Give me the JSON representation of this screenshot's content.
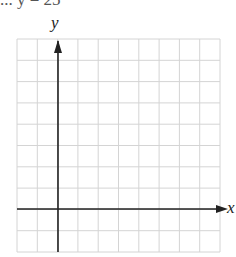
{
  "graph": {
    "clipped_header_text": "... y = 25",
    "x_axis_label": "x",
    "y_axis_label": "y",
    "grid": {
      "columns": 10,
      "rows": 10,
      "left": 17,
      "top": 39,
      "right": 220,
      "bottom": 252,
      "line_color": "#d4d4d4"
    },
    "axes": {
      "y_axis_x": 58,
      "x_axis_y": 209,
      "color": "#222222"
    }
  }
}
